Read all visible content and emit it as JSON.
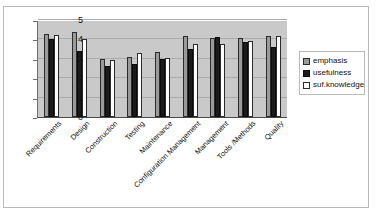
{
  "chart_data": {
    "type": "bar",
    "title": "",
    "xlabel": "",
    "ylabel": "",
    "ylim": [
      0,
      5
    ],
    "yticks": [
      0,
      1,
      2,
      3,
      4,
      5
    ],
    "grid": true,
    "legend_position": "right",
    "categories": [
      "Requirements",
      "Design",
      "Construction",
      "Testing",
      "Maintenance",
      "Configuration Management",
      "Management",
      "Tools /Methods",
      "Quality"
    ],
    "series": [
      {
        "name": "emphasis",
        "color": "#9a9a9a",
        "values": [
          4.3,
          4.4,
          3.0,
          3.1,
          3.35,
          4.2,
          4.05,
          4.05,
          4.2
        ]
      },
      {
        "name": "usefulness",
        "color": "#1b1b1b",
        "values": [
          4.0,
          3.4,
          2.65,
          2.75,
          3.0,
          3.5,
          4.1,
          3.85,
          3.6
        ]
      },
      {
        "name": "suf.knowledge",
        "color": "#ffffff",
        "values": [
          4.25,
          4.0,
          2.95,
          3.3,
          3.05,
          3.75,
          3.75,
          3.9,
          4.2
        ]
      }
    ]
  },
  "legend": {
    "items": [
      {
        "label": "emphasis",
        "swatch": "emphasis-swatch"
      },
      {
        "label": "usefulness",
        "swatch": "usefulness-swatch"
      },
      {
        "label": "suf.knowledge",
        "swatch": "knowledge-swatch"
      }
    ]
  }
}
